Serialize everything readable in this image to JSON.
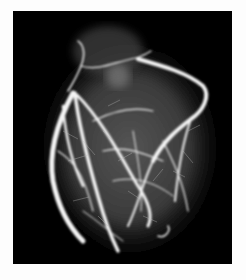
{
  "image": {
    "subject": "Coronary angiogram of a heart",
    "description": "White contrast-filled coronary arteries branching across a heart silhouette on a black background, framed by a white border",
    "colors": {
      "border": "#fdfdfd",
      "background": "#000000",
      "tissue": "#3a3a3a",
      "vessels": "#f4f4f4"
    }
  }
}
